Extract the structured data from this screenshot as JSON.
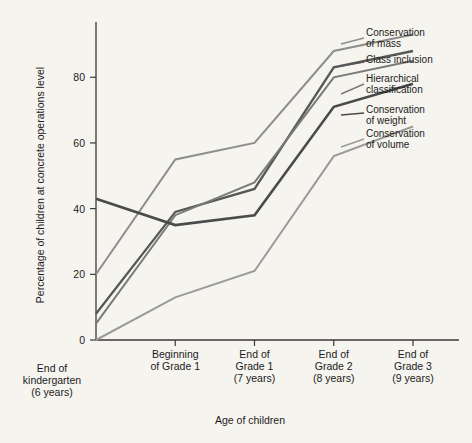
{
  "chart_data": {
    "type": "line",
    "title": "",
    "xlabel": "Age of children",
    "ylabel": "Percentage of children at concrete operations level",
    "ylim": [
      0,
      95
    ],
    "yticks": [
      0,
      20,
      40,
      60,
      80
    ],
    "ytick_labels": [
      "0",
      "20",
      "40",
      "60",
      "80"
    ],
    "grid": false,
    "legend_position": "right-inline-leader-lines",
    "categories": [
      "End of kindergarten (6 years)",
      "Beginning of Grade 1",
      "End of Grade 1 (7 years)",
      "End of Grade 2 (8 years)",
      "End of Grade 3 (9 years)"
    ],
    "category_lines": [
      [
        "End of",
        "kindergarten",
        "(6 years)"
      ],
      [
        "Beginning",
        "of Grade 1"
      ],
      [
        "End of",
        "Grade 1",
        "(7 years)"
      ],
      [
        "End of",
        "Grade 2",
        "(8 years)"
      ],
      [
        "End of",
        "Grade 3",
        "(9 years)"
      ]
    ],
    "series": [
      {
        "name": "Conservation of mass",
        "label_lines": [
          "Conservation",
          "of mass"
        ],
        "color": "#8d8d8d",
        "values": [
          20,
          55,
          60,
          88,
          93
        ]
      },
      {
        "name": "Class inclusion",
        "label_lines": [
          "Class inclusion"
        ],
        "color": "#575757",
        "values": [
          8,
          39,
          46,
          83,
          88
        ]
      },
      {
        "name": "Hierarchical classification",
        "label_lines": [
          "Hierarchical",
          "classification"
        ],
        "color": "#7a7a7a",
        "values": [
          5,
          38,
          48,
          80,
          85
        ]
      },
      {
        "name": "Conservation of weight",
        "label_lines": [
          "Conservation",
          "of weight"
        ],
        "color": "#4a4a4a",
        "values": [
          43,
          35,
          38,
          71,
          78
        ]
      },
      {
        "name": "Conservation of volume",
        "label_lines": [
          "Conservation",
          "of volume"
        ],
        "color": "#9a9a9a",
        "values": [
          0,
          13,
          21,
          56,
          65
        ]
      }
    ]
  },
  "colors": {
    "background": "#f6f4ef",
    "axis": "#3a3a3a",
    "text": "#1b1b1b"
  }
}
